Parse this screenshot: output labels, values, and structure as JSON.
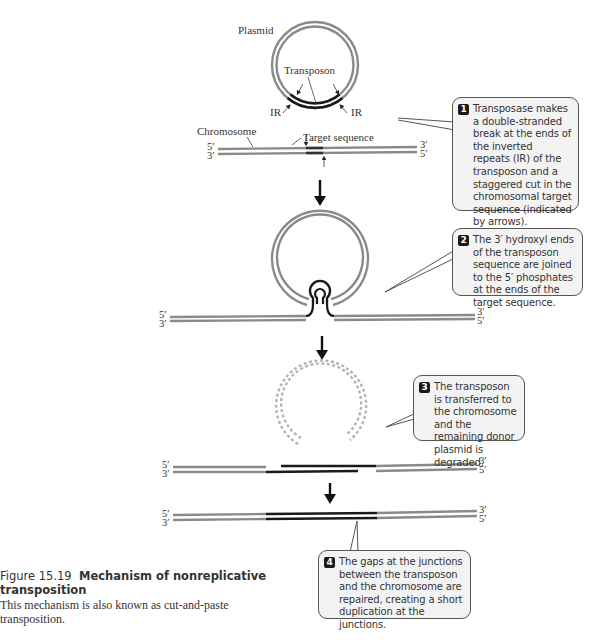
{
  "colors": {
    "chromosome_strand": "#8a8a8a",
    "transposon_strand": "#1a1a1a",
    "degraded_plasmid": "#b4b4b4",
    "callout_fill": "#f3f3f3",
    "callout_border": "#555555",
    "step_badge": "#1a1a1a"
  },
  "step1": {
    "plasmid_label": "Plasmid",
    "transposon_label": "Transposon",
    "ir_left": "IR",
    "ir_right": "IR",
    "chromosome_label": "Chromosome",
    "target_label": "Target sequence",
    "left_top": "5′",
    "left_bottom": "3′",
    "right_top": "3′",
    "right_bottom": "5′"
  },
  "step2": {
    "left_top": "5′",
    "left_bottom": "3′",
    "right_top": "3′",
    "right_bottom": "5′"
  },
  "step3": {
    "left_top": "5′",
    "left_bottom": "3′",
    "right_top": "3′",
    "right_bottom": "5′"
  },
  "step4": {
    "left_top": "5′",
    "left_bottom": "3′",
    "right_top": "3′",
    "right_bottom": "5′"
  },
  "callouts": [
    {
      "number": "1",
      "text": "Transposase makes a double-stranded break at the ends of the inverted repeats (IR) of the transposon and a staggered cut in the chromosomal target sequence (indicated by arrows)."
    },
    {
      "number": "2",
      "text": "The 3′ hydroxyl ends of the transposon sequence are joined to the 5′ phosphates at the ends of the target sequence."
    },
    {
      "number": "3",
      "text": "The transposon is transferred to the chromosome and the remaining donor plasmid is degraded."
    },
    {
      "number": "4",
      "text": "The gaps at the junctions between the transposon and the chromosome are repaired, creating a short duplication at the junctions."
    }
  ],
  "caption": {
    "figure_number": "Figure 15.19",
    "title": "Mechanism of nonreplicative transposition",
    "description": "This mechanism is also known as cut-and-paste transposition."
  }
}
